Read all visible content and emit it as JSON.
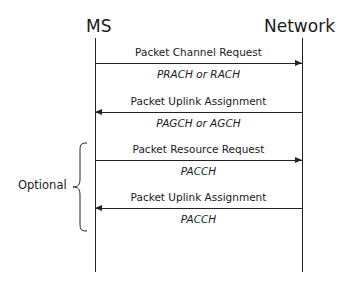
{
  "diagram": {
    "type": "sequence",
    "participants": [
      {
        "label": "MS"
      },
      {
        "label": "Network"
      }
    ],
    "messages": [
      {
        "label": "Packet Channel Request",
        "channel": "PRACH or RACH",
        "direction": "MS->Network"
      },
      {
        "label": "Packet Uplink Assignment",
        "channel": "PAGCH or AGCH",
        "direction": "Network->MS"
      },
      {
        "label": "Packet Resource Request",
        "channel": "PACCH",
        "direction": "MS->Network"
      },
      {
        "label": "Packet Uplink Assignment",
        "channel": "PACCH",
        "direction": "Network->MS"
      }
    ],
    "group": {
      "label": "Optional",
      "covers_messages": [
        3,
        4
      ]
    }
  }
}
